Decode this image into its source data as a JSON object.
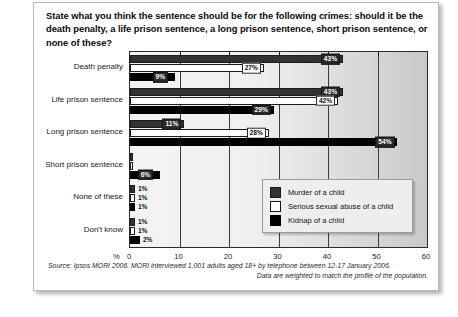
{
  "question": "State what you think the sentence should be for the following crimes: should it be the death penalty, a life prison sentence, a long prison sentence,  short prison sentence, or none of these?",
  "source": {
    "line1": "Source: Ipsos MORI 2006. MORI interviewed 1,001 adults aged 18+ by telephone between 12-17 January 2006.",
    "line2": "Data are weighted to match the profile of the population."
  },
  "legend": {
    "position": "inside-bottom-right",
    "items": [
      {
        "label": "Murder of a child",
        "color": "#333333",
        "swatch": "s0"
      },
      {
        "label": "Serious sexual abuse of a child",
        "color": "#ffffff",
        "swatch": "s1"
      },
      {
        "label": "Kidnap of a child",
        "color": "#000000",
        "swatch": "s2"
      }
    ]
  },
  "chart_data": {
    "type": "bar",
    "orientation": "horizontal",
    "title": "",
    "xlabel": "%",
    "ylabel": "",
    "xlim": [
      0,
      60
    ],
    "xticks": [
      0,
      10,
      20,
      30,
      40,
      50,
      60
    ],
    "xtick_labels": [
      "0",
      "10",
      "20",
      "30",
      "40",
      "50",
      "60"
    ],
    "grid": true,
    "categories": [
      "Death penalty",
      "Life prison sentence",
      "Long prison sentence",
      "Short prison sentence",
      "None of these",
      "Don't know"
    ],
    "series": [
      {
        "name": "Murder of a child",
        "color": "#333333",
        "values": [
          43,
          43,
          11,
          0,
          1,
          1
        ],
        "labels": [
          "43%",
          "43%",
          "11%",
          "",
          "1%",
          "1%"
        ]
      },
      {
        "name": "Serious sexual abuse of a child",
        "color": "#ffffff",
        "values": [
          27,
          42,
          28,
          0,
          1,
          1
        ],
        "labels": [
          "27%",
          "42%",
          "28%",
          "",
          "1%",
          "1%"
        ]
      },
      {
        "name": "Kidnap of a child",
        "color": "#000000",
        "values": [
          9,
          29,
          54,
          6,
          1,
          2
        ],
        "labels": [
          "9%",
          "29%",
          "54%",
          "6%",
          "1%",
          "2%"
        ]
      }
    ]
  }
}
